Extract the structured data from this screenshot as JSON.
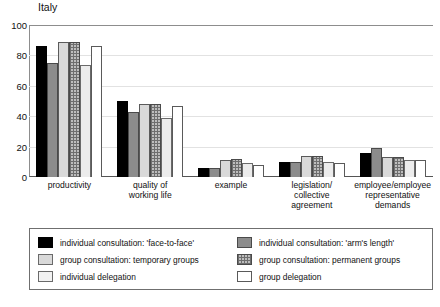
{
  "chart_data": {
    "type": "bar",
    "title": "Italy",
    "xlabel": "",
    "ylabel": "",
    "ylim": [
      0,
      100
    ],
    "yticks": [
      0,
      20,
      40,
      60,
      80,
      100
    ],
    "grid": true,
    "legend_position": "bottom",
    "categories": [
      "productivity",
      "quality of\nworking life",
      "example",
      "legislation/\ncollective agreement",
      "employee/employee\nrepresentative\ndemands"
    ],
    "category_labels": [
      [
        "productivity"
      ],
      [
        "quality of",
        "working life"
      ],
      [
        "example"
      ],
      [
        "legislation/",
        "collective agreement"
      ],
      [
        "employee/employee",
        "representative",
        "demands"
      ]
    ],
    "series": [
      {
        "name": "individual consultation: 'face-to-face'",
        "color": "#000000",
        "pattern": "solid-black",
        "values": [
          86,
          50,
          6,
          10,
          16
        ]
      },
      {
        "name": "individual consultation: 'arm's length'",
        "color": "#8c8c8c",
        "pattern": "solid-gray",
        "values": [
          75,
          43,
          6,
          10,
          19
        ]
      },
      {
        "name": "group consultation: temporary groups",
        "color": "#d9d9d9",
        "pattern": "solid-light-gray",
        "values": [
          89,
          48,
          11,
          14,
          13
        ]
      },
      {
        "name": "group consultation: permanent groups",
        "color": "#bdbdbd",
        "pattern": "crosshatch",
        "values": [
          89,
          48,
          12,
          14,
          13
        ]
      },
      {
        "name": "individual delegation",
        "color": "#ececec",
        "pattern": "solid-pale",
        "values": [
          74,
          39,
          9,
          10,
          11
        ]
      },
      {
        "name": "group delegation",
        "color": "#ffffff",
        "pattern": "outline-white",
        "values": [
          86,
          47,
          8,
          9,
          11
        ]
      }
    ]
  },
  "legend": {
    "entries": [
      {
        "label": "individual consultation: 'face-to-face'",
        "swatch": "sw0"
      },
      {
        "label": "individual consultation: 'arm's length'",
        "swatch": "sw3"
      },
      {
        "label": "group consultation: temporary groups",
        "swatch": "sw1"
      },
      {
        "label": "group consultation: permanent groups",
        "swatch": "sw4"
      },
      {
        "label": "individual delegation",
        "swatch": "sw2"
      },
      {
        "label": "group delegation",
        "swatch": "sw5"
      }
    ]
  }
}
